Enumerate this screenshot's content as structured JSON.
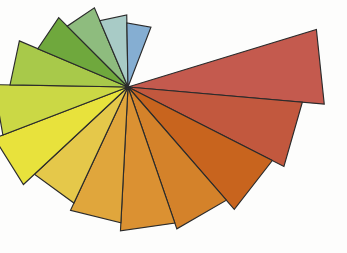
{
  "figure": {
    "title": "",
    "background_color": "#fdfdfc",
    "width": 347,
    "height": 253
  },
  "chart_data": {
    "type": "pie",
    "variant": "polar-area-rose",
    "title": "",
    "subtitle": "",
    "xlabel": "",
    "ylabel": "",
    "legend_position": "none",
    "grid": false,
    "axis_visible": false,
    "tick_labels": [],
    "annotations": [],
    "center": {
      "x": 128,
      "y": 87
    },
    "angular_units": "degrees_clockwise_from_east",
    "sector_angular_width": 22.2,
    "total_sweep_degrees": 311,
    "empty_gap_degrees": 49,
    "radius_units": "pixels",
    "radius_max": 197,
    "outline_color": "#2b2b2b",
    "outline_width": 1.15,
    "categories": [
      "Wedge 1",
      "Wedge 2",
      "Wedge 3",
      "Wedge 4",
      "Wedge 5",
      "Wedge 6",
      "Wedge 7",
      "Wedge 8",
      "Wedge 9",
      "Wedge 10",
      "Wedge 11",
      "Wedge 12",
      "Wedge 13",
      "Wedge 14"
    ],
    "values": [
      197,
      175,
      162,
      150,
      144,
      136,
      128,
      143,
      134,
      118,
      98,
      86,
      72,
      64
    ],
    "start_angles": [
      -17,
      5,
      27,
      49,
      71,
      93,
      115,
      137,
      159,
      181,
      203,
      225,
      247,
      269
    ],
    "end_angles": [
      5,
      27,
      49,
      71,
      93,
      115,
      137,
      159,
      181,
      203,
      225,
      247,
      269,
      291
    ],
    "colors": [
      "#c45a4e",
      "#c2583e",
      "#c8641e",
      "#d4822a",
      "#db9132",
      "#e0a63c",
      "#e5c council",
      "#e8e23c",
      "#cbd845",
      "#a8c94a",
      "#6fa83d",
      "#8ebc7e",
      "#a8cbc6",
      "#85aed2"
    ],
    "series": [
      {
        "name": "radius",
        "values": [
          197,
          175,
          162,
          150,
          144,
          136,
          128,
          143,
          134,
          118,
          98,
          86,
          72,
          64
        ]
      }
    ]
  },
  "wedges": [
    {
      "name": "wedge-red",
      "label": "Wedge 1",
      "color": "#c45a4e",
      "radius": 197,
      "start_angle": -17,
      "end_angle": 5
    },
    {
      "name": "wedge-red-orange",
      "label": "Wedge 2",
      "color": "#c2583e",
      "radius": 175,
      "start_angle": 5,
      "end_angle": 27
    },
    {
      "name": "wedge-burnt-orange",
      "label": "Wedge 3",
      "color": "#c8641e",
      "radius": 162,
      "start_angle": 27,
      "end_angle": 49
    },
    {
      "name": "wedge-orange",
      "label": "Wedge 4",
      "color": "#d4822a",
      "radius": 150,
      "start_angle": 49,
      "end_angle": 71
    },
    {
      "name": "wedge-amber",
      "label": "Wedge 5",
      "color": "#db9132",
      "radius": 144,
      "start_angle": 71,
      "end_angle": 93
    },
    {
      "name": "wedge-gold",
      "label": "Wedge 6",
      "color": "#e0a63c",
      "radius": 136,
      "start_angle": 93,
      "end_angle": 115
    },
    {
      "name": "wedge-light-gold",
      "label": "Wedge 7",
      "color": "#e5c84a",
      "radius": 128,
      "start_angle": 115,
      "end_angle": 137
    },
    {
      "name": "wedge-yellow",
      "label": "Wedge 8",
      "color": "#e8e23c",
      "radius": 143,
      "start_angle": 137,
      "end_angle": 159
    },
    {
      "name": "wedge-yellow-green",
      "label": "Wedge 9",
      "color": "#cbd845",
      "radius": 134,
      "start_angle": 159,
      "end_angle": 181
    },
    {
      "name": "wedge-lime",
      "label": "Wedge 10",
      "color": "#a8c94a",
      "radius": 118,
      "start_angle": 181,
      "end_angle": 203
    },
    {
      "name": "wedge-green",
      "label": "Wedge 11",
      "color": "#6fa83d",
      "radius": 98,
      "start_angle": 203,
      "end_angle": 225
    },
    {
      "name": "wedge-sage",
      "label": "Wedge 12",
      "color": "#8ebc7e",
      "radius": 86,
      "start_angle": 225,
      "end_angle": 247
    },
    {
      "name": "wedge-teal",
      "label": "Wedge 13",
      "color": "#a8cbc6",
      "radius": 72,
      "start_angle": 247,
      "end_angle": 269
    },
    {
      "name": "wedge-steel-blue",
      "label": "Wedge 14",
      "color": "#85aed2",
      "radius": 64,
      "start_angle": 269,
      "end_angle": 291
    }
  ],
  "extra_wedges": [
    {
      "name": "wedge-sage-outer",
      "label": "Wedge 12b",
      "color": "#9dc3a8",
      "radius": 100,
      "start_angle": 225,
      "end_angle": 247
    },
    {
      "name": "wedge-light-blue",
      "label": "Wedge 15",
      "color": "#9dbfdd",
      "radius": 76,
      "start_angle": 269,
      "end_angle": 287
    },
    {
      "name": "wedge-deep-blue",
      "label": "Wedge 16",
      "color": "#6a92c8",
      "radius": 70,
      "start_angle": 287,
      "end_angle": 311
    }
  ]
}
